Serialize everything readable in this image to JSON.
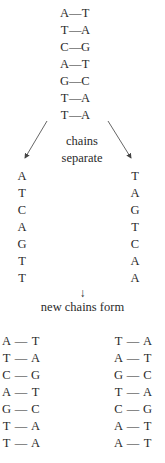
{
  "original_duplex": {
    "pairs": [
      {
        "left": "A",
        "right": "T"
      },
      {
        "left": "T",
        "right": "A"
      },
      {
        "left": "C",
        "right": "G"
      },
      {
        "left": "A",
        "right": "T"
      },
      {
        "left": "G",
        "right": "C"
      },
      {
        "left": "T",
        "right": "A"
      },
      {
        "left": "T",
        "right": "A"
      }
    ],
    "bond": "—"
  },
  "step1_label_line1": "chains",
  "step1_label_line2": "separate",
  "separated": {
    "left": [
      "A",
      "T",
      "C",
      "A",
      "G",
      "T",
      "T"
    ],
    "right": [
      "T",
      "A",
      "G",
      "T",
      "C",
      "A",
      "A"
    ]
  },
  "step2_arrow": "↓",
  "step2_label": "new chains form",
  "new_duplex_left": {
    "pairs": [
      {
        "left": "A",
        "right": "T"
      },
      {
        "left": "T",
        "right": "A"
      },
      {
        "left": "C",
        "right": "G"
      },
      {
        "left": "A",
        "right": "T"
      },
      {
        "left": "G",
        "right": "C"
      },
      {
        "left": "T",
        "right": "A"
      },
      {
        "left": "T",
        "right": "A"
      }
    ]
  },
  "new_duplex_right": {
    "pairs": [
      {
        "left": "T",
        "right": "A"
      },
      {
        "left": "A",
        "right": "T"
      },
      {
        "left": "G",
        "right": "C"
      },
      {
        "left": "T",
        "right": "A"
      },
      {
        "left": "C",
        "right": "G"
      },
      {
        "left": "A",
        "right": "T"
      },
      {
        "left": "A",
        "right": "T"
      }
    ]
  }
}
